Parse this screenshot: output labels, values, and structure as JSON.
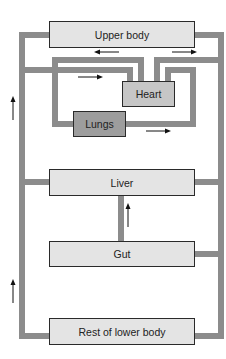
{
  "diagram": {
    "type": "circulatory-system-schematic",
    "nodes": {
      "upper_body": "Upper body",
      "heart": "Heart",
      "lungs": "Lungs",
      "liver": "Liver",
      "gut": "Gut",
      "lower_body": "Rest of lower body"
    },
    "colors": {
      "pipe": "#8c8c8c",
      "box_light": "#e4e4e4",
      "heart_fill": "#c6c6c6",
      "lungs_fill": "#9d9d9d",
      "border": "#2a2a2a",
      "arrow": "#111111"
    },
    "arrows": [
      {
        "id": "upper-left",
        "direction": "left"
      },
      {
        "id": "upper-right",
        "direction": "right"
      },
      {
        "id": "to-heart",
        "direction": "right"
      },
      {
        "id": "from-lungs",
        "direction": "right"
      },
      {
        "id": "left-upper",
        "direction": "up"
      },
      {
        "id": "gut-to-liver",
        "direction": "up"
      },
      {
        "id": "left-lower",
        "direction": "up"
      }
    ]
  }
}
